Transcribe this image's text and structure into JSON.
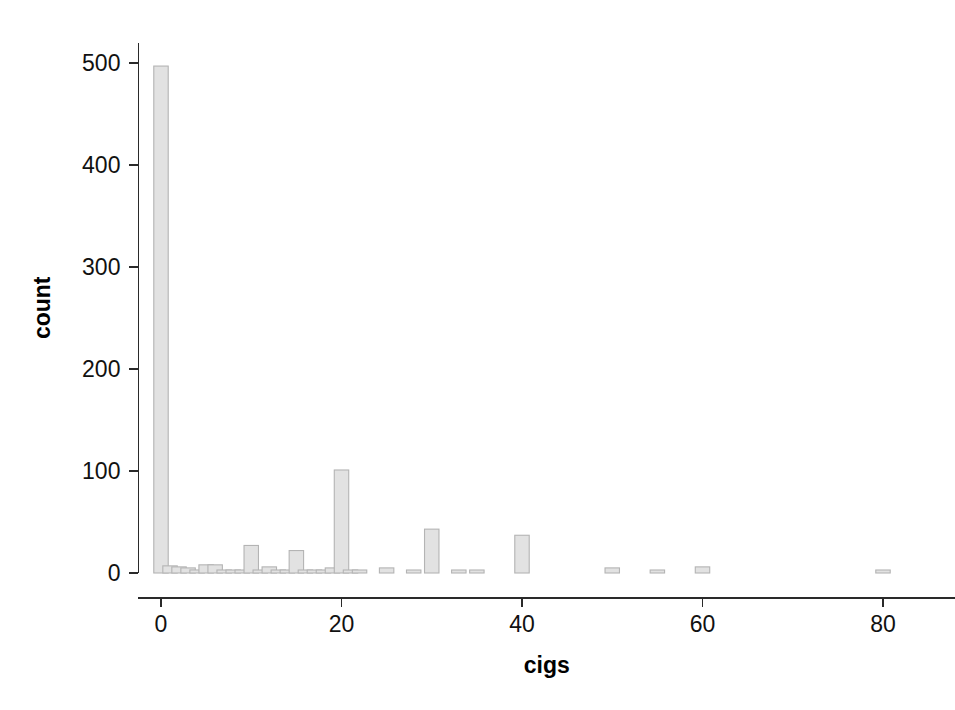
{
  "chart_data": {
    "type": "bar",
    "title": "",
    "subtitle": "",
    "xlabel": "cigs",
    "ylabel": "count",
    "xlim": [
      -2.5,
      88
    ],
    "ylim": [
      0,
      520
    ],
    "x_ticks": [
      0,
      20,
      40,
      60,
      80
    ],
    "y_ticks": [
      0,
      100,
      200,
      300,
      400,
      500
    ],
    "x_tick_labels": [
      "0",
      "20",
      "40",
      "60",
      "80"
    ],
    "y_tick_labels": [
      "0",
      "100",
      "200",
      "300",
      "400",
      "500"
    ],
    "grid": false,
    "legend": null,
    "bar_color": "#e2e2e2",
    "bar_edge_color": "#b4b4b4",
    "axis_color": "#2a2a2a",
    "background_color": "#ffffff",
    "bar_width_units": 1.6,
    "x": [
      0,
      1,
      2,
      3,
      4,
      5,
      6,
      7,
      8,
      9,
      10,
      11,
      12,
      13,
      14,
      15,
      16,
      17,
      18,
      19,
      20,
      21,
      22,
      25,
      28,
      30,
      33,
      35,
      40,
      50,
      55,
      60,
      80
    ],
    "values": [
      497,
      7,
      6,
      5,
      3,
      8,
      8,
      2,
      2,
      1,
      27,
      1,
      6,
      2,
      1,
      22,
      2,
      1,
      1,
      5,
      101,
      1,
      1,
      5,
      2,
      43,
      1,
      2,
      37,
      5,
      1,
      6,
      1
    ],
    "categories": [
      "0",
      "1",
      "2",
      "3",
      "4",
      "5",
      "6",
      "7",
      "8",
      "9",
      "10",
      "11",
      "12",
      "13",
      "14",
      "15",
      "16",
      "17",
      "18",
      "19",
      "20",
      "21",
      "22",
      "25",
      "28",
      "30",
      "33",
      "35",
      "40",
      "50",
      "55",
      "60",
      "80"
    ]
  }
}
